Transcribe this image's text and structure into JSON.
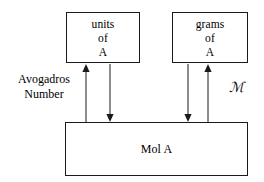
{
  "diagram": {
    "background_color": "#ffffff",
    "stroke_color": "#1a1a1a",
    "boxes": {
      "units_of_a": {
        "line1": "units",
        "line2": "of",
        "line3": "A"
      },
      "grams_of_a": {
        "line1": "grams",
        "line2": "of",
        "line3": "A"
      },
      "mol_a": {
        "line1": "Mol A"
      }
    },
    "labels": {
      "avogadros_line1": "Avogadros",
      "avogadros_line2": "Number",
      "molar_mass_symbol": "ℳ"
    },
    "arrows": [
      {
        "name": "units-to-mol-up",
        "from": "Mol A",
        "to": "units of A",
        "direction": "up"
      },
      {
        "name": "units-to-mol-down",
        "from": "units of A",
        "to": "Mol A",
        "direction": "down"
      },
      {
        "name": "grams-to-mol-down",
        "from": "grams of A",
        "to": "Mol A",
        "direction": "down"
      },
      {
        "name": "grams-to-mol-up",
        "from": "Mol A",
        "to": "grams of A",
        "direction": "up"
      }
    ]
  }
}
